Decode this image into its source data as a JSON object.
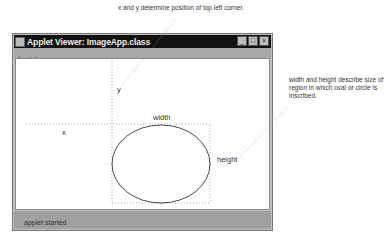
{
  "captions": {
    "top": "x and y determine position of top left corner.",
    "right": "width and height describe size of region in which oval or circle is inscribed."
  },
  "window": {
    "title": "Applet Viewer: ImageApp.class",
    "controls": {
      "minimize": "_",
      "maximize": "□",
      "close": "×"
    },
    "menu": [
      "Applet"
    ],
    "status": "applet started"
  },
  "diagram": {
    "labels": {
      "x": "x",
      "y": "y",
      "width": "width",
      "height": "height"
    }
  }
}
